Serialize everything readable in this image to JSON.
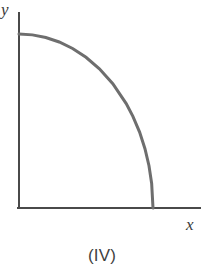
{
  "figure": {
    "caption": "(IV)",
    "background_color": "#ffffff"
  },
  "axes": {
    "x_label": "x",
    "y_label": "y",
    "axis_color": "#4a4a4a",
    "axis_width": 2,
    "origin_px": [
      19,
      208
    ],
    "x_axis_end_px": [
      200,
      208
    ],
    "y_axis_top_px": [
      19,
      13
    ]
  },
  "chart_data": {
    "type": "line",
    "title": "(IV)",
    "xlabel": "x",
    "ylabel": "y",
    "grid": false,
    "legend": null,
    "axis_arrows": false,
    "tick_labels": {
      "x": [],
      "y": []
    },
    "xlim": [
      0,
      1.15
    ],
    "ylim": [
      0,
      1.12
    ],
    "series": [
      {
        "name": "concave decreasing curve",
        "color": "#6e6e6e",
        "line_width": 3,
        "description": "quarter-ellipse arc, starts at y-intercept with zero slope and descends to meet the x-axis vertically",
        "x": [
          0.0,
          0.1,
          0.2,
          0.3,
          0.4,
          0.5,
          0.6,
          0.7,
          0.8,
          0.85,
          0.9,
          0.94,
          0.97,
          0.99,
          1.0
        ],
        "y": [
          1.0,
          0.995,
          0.98,
          0.954,
          0.917,
          0.866,
          0.8,
          0.714,
          0.6,
          0.527,
          0.436,
          0.341,
          0.243,
          0.141,
          0.0
        ]
      }
    ],
    "annotations": [
      {
        "text": "y",
        "position_px": [
          5,
          4
        ],
        "italic": true
      },
      {
        "text": "x",
        "position_px": [
          188,
          220
        ],
        "italic": true
      },
      {
        "text": "(IV)",
        "position_px": [
          102,
          258
        ],
        "italic": false
      }
    ]
  }
}
